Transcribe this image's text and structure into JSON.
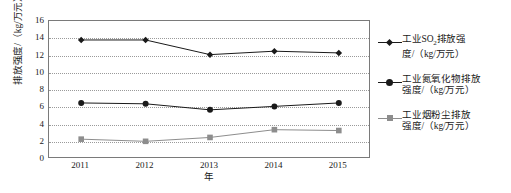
{
  "chart_data": {
    "type": "line",
    "title": "",
    "xlabel": "年",
    "ylabel": "排放强度/（kg/万元）",
    "categories": [
      "2011",
      "2012",
      "2013",
      "2014",
      "2015"
    ],
    "ylim": [
      0,
      16
    ],
    "yticks": [
      0,
      2,
      4,
      6,
      8,
      10,
      12,
      14,
      16
    ],
    "grid": true,
    "legend_position": "right",
    "series": [
      {
        "name": "工业SO₂排放强度/（kg/万元）",
        "marker": "diamond",
        "color": "#1a1a1a",
        "values": [
          13.8,
          13.8,
          12.1,
          12.5,
          12.3
        ]
      },
      {
        "name": "工业氮氧化物排放强度/（kg/万元）",
        "marker": "circle",
        "color": "#1a1a1a",
        "values": [
          6.5,
          6.4,
          5.7,
          6.1,
          6.5
        ]
      },
      {
        "name": "工业烟粉尘排放强度/（kg/万元）",
        "marker": "square",
        "color": "#8d8d8d",
        "values": [
          2.3,
          2.05,
          2.5,
          3.4,
          3.3
        ]
      }
    ]
  },
  "legend": {
    "items": [
      {
        "line1": "工业SO",
        "sub": "2",
        "line1b": "排放强",
        "line2": "度/（kg/万元）"
      },
      {
        "line1": "工业氮氧化物排放",
        "sub": "",
        "line1b": "",
        "line2": "强度/（kg/万元）"
      },
      {
        "line1": "工业烟粉尘排放",
        "sub": "",
        "line1b": "",
        "line2": "强度/（kg/万元）"
      }
    ]
  }
}
